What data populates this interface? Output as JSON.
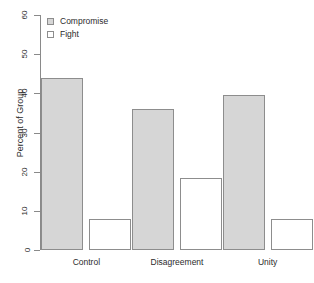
{
  "chart_data": {
    "type": "bar",
    "title": "",
    "xlabel": "",
    "ylabel": "Percent of Group",
    "ylim": [
      0,
      60
    ],
    "yticks": [
      0,
      10,
      20,
      30,
      40,
      50,
      60
    ],
    "grid": false,
    "legend_position": "top-left",
    "categories": [
      "Control",
      "Disagreement",
      "Unity"
    ],
    "series": [
      {
        "name": "Compromise",
        "color": "#d6d6d6",
        "values": [
          44,
          36,
          39.5
        ]
      },
      {
        "name": "Fight",
        "color": "#ffffff",
        "values": [
          8,
          18.5,
          8
        ]
      }
    ]
  },
  "axis": {
    "y_title": "Percent of Group",
    "y_tick_labels": [
      "0",
      "10",
      "20",
      "30",
      "40",
      "50",
      "60"
    ],
    "x_tick_labels": [
      "Control",
      "Disagreement",
      "Unity"
    ]
  },
  "legend": {
    "items": [
      {
        "label": "Compromise",
        "swatch": "filled-gray-square-icon"
      },
      {
        "label": "Fight",
        "swatch": "empty-white-square-icon"
      }
    ]
  }
}
